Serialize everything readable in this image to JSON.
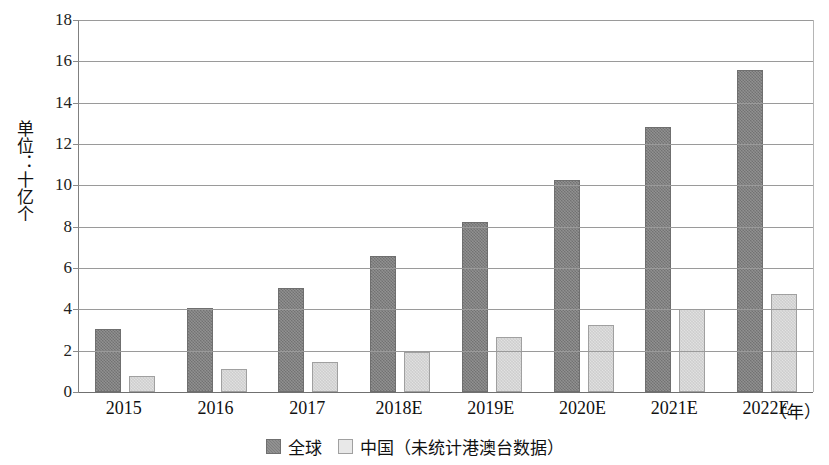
{
  "chart_data": {
    "type": "bar",
    "title": "",
    "subtitle": "",
    "xlabel": "（年）",
    "ylabel": "单位：十亿个",
    "categories": [
      "2015",
      "2016",
      "2017",
      "2018E",
      "2019E",
      "2020E",
      "2021E",
      "2022E"
    ],
    "series": [
      {
        "name": "全球",
        "color": "#7f7f7f",
        "values": [
          3.05,
          4.05,
          5.03,
          6.58,
          8.22,
          10.25,
          12.8,
          15.6
        ]
      },
      {
        "name": "中国（未统计港澳台数据）",
        "color": "#e3e3e3",
        "values": [
          0.77,
          1.11,
          1.45,
          1.93,
          2.66,
          3.24,
          4.0,
          4.75
        ]
      }
    ],
    "ylim": [
      0,
      18
    ],
    "ytick_step": 2,
    "yticks": [
      "18",
      "16",
      "14",
      "12",
      "10",
      "8",
      "6",
      "4",
      "2",
      "0"
    ],
    "grid": true,
    "grid_axis": "y",
    "legend_position": "bottom-center"
  },
  "axis": {
    "y_title": "单位：十亿个",
    "x_unit_label": "（年）"
  },
  "legend": {
    "items": [
      {
        "label": "全球",
        "swatch": "dark-gray-swatch"
      },
      {
        "label": "中国（未统计港澳台数据）",
        "swatch": "light-gray-swatch"
      }
    ]
  }
}
